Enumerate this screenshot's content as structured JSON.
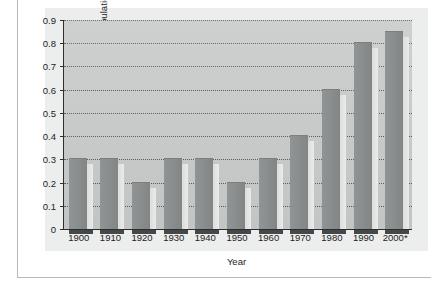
{
  "chart_data": {
    "type": "bar",
    "title": "",
    "xlabel": "Year",
    "ylabel": "Percentage of the U.S. Population",
    "categories": [
      "1900",
      "1910",
      "1920",
      "1930",
      "1940",
      "1950",
      "1960",
      "1970",
      "1980",
      "1990",
      "2000*"
    ],
    "values": [
      0.3,
      0.3,
      0.2,
      0.3,
      0.3,
      0.2,
      0.3,
      0.4,
      0.6,
      0.8,
      0.85
    ],
    "ylim": [
      0,
      0.9
    ],
    "yticks": [
      0,
      0.1,
      0.2,
      0.3,
      0.4,
      0.5,
      0.6,
      0.7,
      0.8,
      0.9
    ],
    "ytick_labels": [
      "0",
      "0.1",
      "0.2",
      "0.3",
      "0.4",
      "0.5",
      "0.6",
      "0.7",
      "0.8",
      "0.9"
    ],
    "grid": true,
    "grid_style": "dotted",
    "grid_axis": "y",
    "legend": false,
    "legend_position": "none",
    "series": [
      {
        "name": "Percentage of the U.S. Population",
        "values": [
          0.3,
          0.3,
          0.2,
          0.3,
          0.3,
          0.2,
          0.3,
          0.4,
          0.6,
          0.8,
          0.85
        ]
      }
    ]
  },
  "colors": {
    "page_background": "#ffffff",
    "figure_background": "#eceded",
    "plot_background": "#c9cbcb",
    "bar_fill": "#8b8e8e",
    "bar_shadow": "#e2e3e3",
    "axis_line": "#2d2d2d",
    "gridline": "#4a4a4a",
    "text": "#1c1c1c",
    "frame_rule": "#b9b9b9"
  }
}
